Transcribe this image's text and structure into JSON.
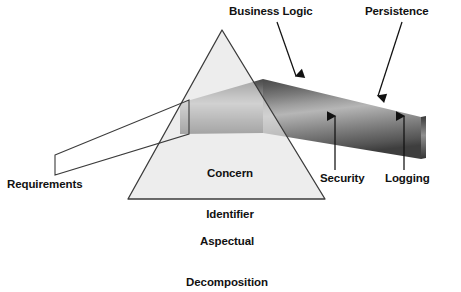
{
  "figure": {
    "background_color": "#ffffff",
    "text_color": "#111111"
  },
  "labels": {
    "business_logic": "Business Logic",
    "persistence": "Persistence",
    "security": "Security",
    "logging": "Logging",
    "requirements": "Requirements",
    "concern_identifier_line1": "Concern",
    "concern_identifier_line2": "Identifier",
    "aspectual_line1": "Aspectual",
    "aspectual_line2": "Decomposition"
  },
  "prism": {
    "name": "Concern Identifier",
    "fill_color": "#e2e2e2",
    "stroke_color": "#3b3b3b",
    "apex": [
      222,
      30
    ],
    "base_left": [
      128,
      199
    ],
    "base_right": [
      325,
      199
    ]
  },
  "input_beam": {
    "name": "Requirements",
    "fill_color": "#ffffff",
    "stroke_color": "#3b3b3b"
  },
  "dispersed_beam": {
    "name": "dispersed concerns beam",
    "bands": [
      {
        "color": "#4a4a4a"
      },
      {
        "color": "#606060"
      },
      {
        "color": "#7c7c7c"
      },
      {
        "color": "#9a9a9a"
      },
      {
        "color": "#b4b4b4"
      },
      {
        "color": "#9c9c9c"
      },
      {
        "color": "#828282"
      },
      {
        "color": "#6a6a6a"
      },
      {
        "color": "#555555"
      },
      {
        "color": "#3f3f3f"
      }
    ]
  },
  "annotations": [
    {
      "label": "Business Logic",
      "direction": "down"
    },
    {
      "label": "Persistence",
      "direction": "down"
    },
    {
      "label": "Security",
      "direction": "up"
    },
    {
      "label": "Logging",
      "direction": "up"
    }
  ]
}
